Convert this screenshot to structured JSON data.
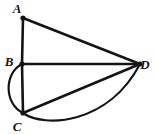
{
  "figure": {
    "kind": "geometry-diagram",
    "canvas": {
      "width": 157,
      "height": 134,
      "background": "#ffffff"
    },
    "stroke": {
      "color": "#141414",
      "segment_width": 2.6,
      "arc_width": 2.2
    },
    "points": [
      {
        "id": "A",
        "label": "A",
        "x": 23,
        "y": 18,
        "label_x": 17,
        "label_y": 13,
        "dot": true
      },
      {
        "id": "B",
        "label": "B",
        "x": 22,
        "y": 64,
        "label_x": 9,
        "label_y": 66,
        "dot": true
      },
      {
        "id": "C",
        "label": "C",
        "x": 23,
        "y": 113,
        "label_x": 17,
        "label_y": 131,
        "dot": true
      },
      {
        "id": "D",
        "label": "D",
        "x": 140,
        "y": 64,
        "label_x": 145,
        "label_y": 69,
        "dot": true
      }
    ],
    "segments": [
      {
        "id": "AB",
        "from": "A",
        "to": "B",
        "x1": 23,
        "y1": 18,
        "x2": 22,
        "y2": 64
      },
      {
        "id": "AD",
        "from": "A",
        "to": "D",
        "x1": 23,
        "y1": 18,
        "x2": 140,
        "y2": 64
      },
      {
        "id": "BD",
        "from": "B",
        "to": "D",
        "x1": 22,
        "y1": 64,
        "x2": 140,
        "y2": 64
      },
      {
        "id": "BC",
        "from": "B",
        "to": "C",
        "x1": 22,
        "y1": 64,
        "x2": 23,
        "y2": 113
      },
      {
        "id": "CD",
        "from": "C",
        "to": "D",
        "x1": 23,
        "y1": 113,
        "x2": 140,
        "y2": 64
      }
    ],
    "arcs": [
      {
        "id": "arc-BC",
        "from": "B",
        "to": "C",
        "bulge": "left",
        "path": "M 22 64 C 4 73, 4 104, 23 113"
      },
      {
        "id": "arc-CD",
        "from": "C",
        "to": "D",
        "bulge": "down",
        "path": "M 23 113 C 44 128, 108 125, 140 64"
      }
    ],
    "labels": [
      "A",
      "B",
      "C",
      "D"
    ]
  }
}
